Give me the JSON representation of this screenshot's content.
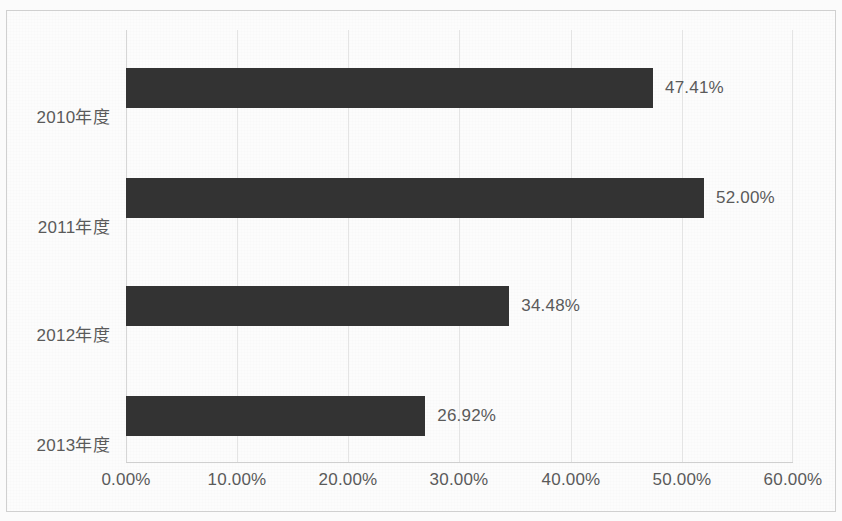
{
  "chart_data": {
    "type": "bar",
    "orientation": "horizontal",
    "title": "",
    "xlabel": "",
    "ylabel": "",
    "categories": [
      "2010年度",
      "2011年度",
      "2012年度",
      "2013年度"
    ],
    "values": [
      47.41,
      52.0,
      34.48,
      26.92
    ],
    "value_labels": [
      "47.41%",
      "52.00%",
      "34.48%",
      "26.92%"
    ],
    "xlim": [
      0,
      60
    ],
    "xticks": [
      0,
      10,
      20,
      30,
      40,
      50,
      60
    ],
    "xtick_labels": [
      "0.00%",
      "10.00%",
      "20.00%",
      "30.00%",
      "40.00%",
      "50.00%",
      "60.00%"
    ],
    "grid": true,
    "legend": false,
    "bar_color": "#333333",
    "text_color": "#5a5a5a",
    "gridline_color": "#e4e4e4",
    "frame_color": "#d0d0d0"
  }
}
